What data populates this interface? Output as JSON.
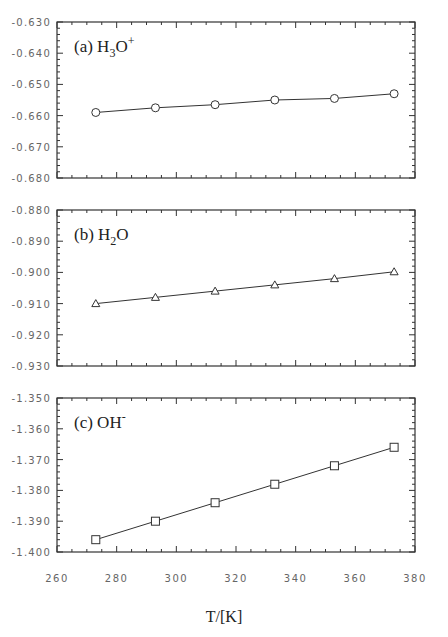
{
  "chart_data": [
    {
      "type": "line",
      "panel_label": "(a) H",
      "panel_label_parts": {
        "prefix": "(a) H",
        "sub": "3",
        "mid": "O",
        "sup": "+"
      },
      "species": "H3O+",
      "marker": "circle",
      "x": [
        273,
        293,
        313,
        333,
        353,
        373
      ],
      "values": [
        -0.659,
        -0.6575,
        -0.6565,
        -0.655,
        -0.6545,
        -0.653
      ],
      "ylim": [
        -0.68,
        -0.63
      ],
      "yticks": [
        "-0.630",
        "-0.640",
        "-0.650",
        "-0.660",
        "-0.670",
        "-0.680"
      ],
      "xlim": [
        260,
        380
      ],
      "grid": false
    },
    {
      "type": "line",
      "panel_label_parts": {
        "prefix": "(b) H",
        "sub": "2",
        "mid": "O",
        "sup": ""
      },
      "species": "H2O",
      "marker": "triangle",
      "x": [
        273,
        293,
        313,
        333,
        353,
        373
      ],
      "values": [
        -0.91,
        -0.908,
        -0.906,
        -0.904,
        -0.902,
        -0.8998
      ],
      "ylim": [
        -0.93,
        -0.88
      ],
      "yticks": [
        "-0.880",
        "-0.890",
        "-0.900",
        "-0.910",
        "-0.920",
        "-0.930"
      ],
      "xlim": [
        260,
        380
      ],
      "grid": false
    },
    {
      "type": "line",
      "panel_label_parts": {
        "prefix": "(c) OH",
        "sub": "",
        "mid": "",
        "sup": "-"
      },
      "species": "OH-",
      "marker": "square",
      "x": [
        273,
        293,
        313,
        333,
        353,
        373
      ],
      "values": [
        -1.396,
        -1.39,
        -1.384,
        -1.378,
        -1.372,
        -1.366
      ],
      "ylim": [
        -1.4,
        -1.35
      ],
      "yticks": [
        "-1.350",
        "-1.360",
        "-1.370",
        "-1.380",
        "-1.390",
        "-1.400"
      ],
      "xlim": [
        260,
        380
      ],
      "grid": false
    }
  ],
  "x_axis": {
    "label": "T/[K]",
    "ticks": [
      "260",
      "280",
      "300",
      "320",
      "340",
      "360",
      "380"
    ]
  }
}
